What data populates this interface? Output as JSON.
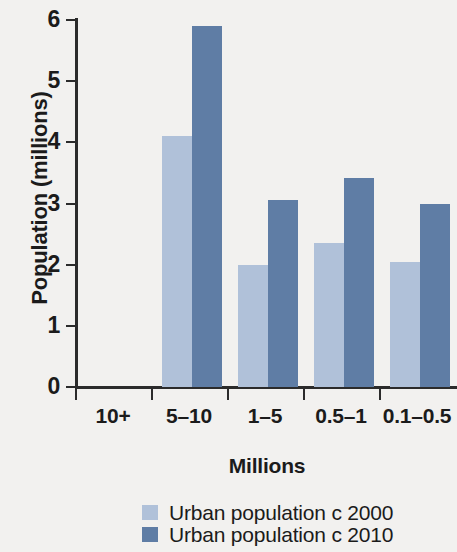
{
  "chart_data": {
    "type": "bar",
    "title": "",
    "xlabel": "Millions",
    "ylabel": "Population (millions)",
    "categories": [
      "10+",
      "5–10",
      "1–5",
      "0.5–1",
      "0.1–0.5"
    ],
    "series": [
      {
        "name": "Urban population c 2000",
        "color": "#b0c1d9",
        "values": [
          0,
          4.1,
          2.0,
          2.35,
          2.05
        ]
      },
      {
        "name": "Urban population c 2010",
        "color": "#5f7da5",
        "values": [
          0,
          5.9,
          3.05,
          3.42,
          3.0
        ]
      }
    ],
    "ylim": [
      0,
      6
    ],
    "ytick_labels": [
      "6",
      "5",
      "4",
      "3",
      "2",
      "1",
      "0"
    ],
    "ytick_values": [
      6,
      5,
      4,
      3,
      2,
      1,
      0
    ],
    "grid": false,
    "legend_position": "bottom-left"
  },
  "legend": {
    "entries": [
      {
        "label": "Urban population c 2000",
        "swatch": "light"
      },
      {
        "label": "Urban population c 2010",
        "swatch": "dark"
      }
    ]
  },
  "colors": {
    "background": "#f2f1ef",
    "axis": "#2b2b2b",
    "text": "#1b1b1b",
    "series_2000": "#b0c1d9",
    "series_2010": "#5f7da5"
  }
}
